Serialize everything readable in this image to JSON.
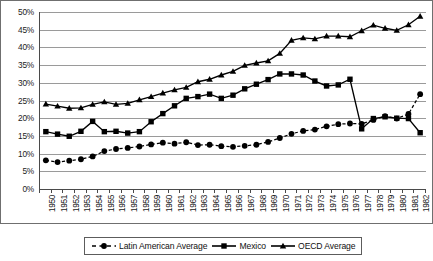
{
  "chart_data": {
    "type": "line",
    "title": "",
    "subtitle": "",
    "xlabel": "",
    "ylabel": "",
    "grid": true,
    "legend_position": "bottom",
    "ylim": [
      0,
      50
    ],
    "ytick_labels": [
      "0%",
      "5%",
      "10%",
      "15%",
      "20%",
      "25%",
      "30%",
      "35%",
      "40%",
      "45%",
      "50%"
    ],
    "ytick_values": [
      0,
      5,
      10,
      15,
      20,
      25,
      30,
      35,
      40,
      45,
      50
    ],
    "x": [
      1950,
      1951,
      1952,
      1953,
      1954,
      1955,
      1956,
      1957,
      1958,
      1959,
      1960,
      1961,
      1962,
      1963,
      1964,
      1965,
      1966,
      1967,
      1968,
      1969,
      1970,
      1971,
      1972,
      1973,
      1974,
      1975,
      1976,
      1977,
      1978,
      1979,
      1980,
      1981,
      1982
    ],
    "categories": [
      "1950",
      "1951",
      "1952",
      "1953",
      "1954",
      "1955",
      "1956",
      "1957",
      "1958",
      "1959",
      "1960",
      "1961",
      "1962",
      "1963",
      "1964",
      "1965",
      "1966",
      "1967",
      "1968",
      "1969",
      "1970",
      "1971",
      "1972",
      "1973",
      "1974",
      "1975",
      "1976",
      "1977",
      "1978",
      "1979",
      "1980",
      "1981",
      "1982"
    ],
    "series": [
      {
        "name": "Latin American Average",
        "marker": "circle",
        "line_style": "dashed",
        "color": "#000000",
        "values": [
          8.1,
          7.6,
          8.0,
          8.4,
          9.2,
          10.7,
          11.3,
          11.6,
          12.0,
          12.6,
          13.1,
          12.8,
          13.2,
          12.4,
          12.5,
          12.1,
          11.9,
          12.2,
          12.5,
          13.3,
          14.4,
          15.6,
          16.4,
          16.8,
          17.7,
          18.3,
          18.5,
          18.4,
          19.5,
          20.6,
          19.9,
          21.2,
          26.8
        ]
      },
      {
        "name": "Mexico",
        "marker": "square",
        "line_style": "solid",
        "color": "#000000",
        "values": [
          16.2,
          15.5,
          14.9,
          16.3,
          19.1,
          16.2,
          16.3,
          15.8,
          16.2,
          19.0,
          21.3,
          23.5,
          25.6,
          26.1,
          26.8,
          25.6,
          26.5,
          28.3,
          29.6,
          30.9,
          32.5,
          32.5,
          32.2,
          30.5,
          29.1,
          29.4,
          31.0,
          17.0,
          19.9,
          20.4,
          20.0,
          19.9,
          15.9
        ]
      },
      {
        "name": "OECD Average",
        "marker": "triangle",
        "line_style": "solid",
        "color": "#000000",
        "values": [
          24.0,
          23.4,
          22.8,
          22.9,
          23.9,
          24.6,
          23.9,
          24.2,
          25.2,
          26.1,
          27.1,
          28.0,
          28.7,
          30.3,
          31.0,
          32.2,
          33.2,
          34.9,
          35.6,
          36.2,
          38.3,
          42.0,
          42.7,
          42.4,
          43.2,
          43.2,
          43.0,
          44.7,
          46.3,
          45.4,
          44.8,
          46.4,
          48.8
        ]
      }
    ]
  },
  "legend": {
    "items": [
      {
        "label": "Latin American Average",
        "marker": "circle-marker-icon",
        "style": "dashed"
      },
      {
        "label": "Mexico",
        "marker": "square-marker-icon",
        "style": "solid"
      },
      {
        "label": "OECD Average",
        "marker": "triangle-marker-icon",
        "style": "solid"
      }
    ]
  }
}
